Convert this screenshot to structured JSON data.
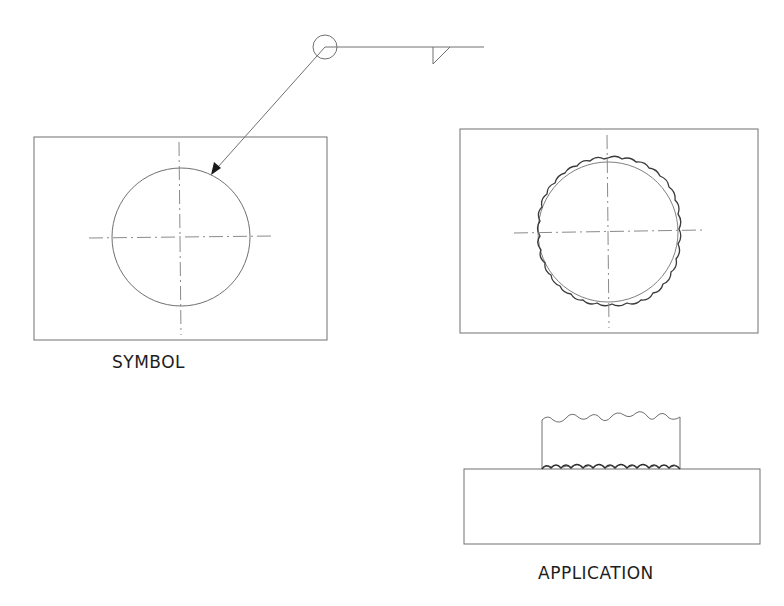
{
  "diagram": {
    "colors": {
      "background": "#ffffff",
      "line": "#707070",
      "centerline": "#8a8a8a",
      "weld_bead": "#3a3a3a",
      "text": "#1e1e1e"
    },
    "panels": [
      {
        "id": "symbol",
        "label": "SYMBOL",
        "description": "Plate with circular hole, weld symbol arrow pointing to circle edge"
      },
      {
        "id": "application-top",
        "label": "",
        "description": "Top view: circle with weld bead around full perimeter"
      },
      {
        "id": "application-side",
        "label": "APPLICATION",
        "description": "Side view: cylinder stub welded to base plate with fillet bead"
      }
    ],
    "weld_symbol": {
      "weld_all_around": true,
      "weld_type": "fillet",
      "side": "arrow side"
    }
  },
  "labels": {
    "symbol": "SYMBOL",
    "application": "APPLICATION"
  }
}
